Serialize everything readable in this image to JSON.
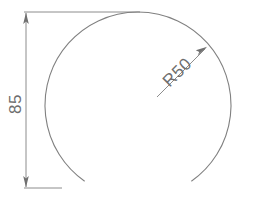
{
  "drawing": {
    "title": "Arc profile with radius and height dimensions",
    "background_color": "#ffffff",
    "line_color": "#808080",
    "text_color": "#6e6e6e",
    "line_width": 1,
    "dimensions": [
      {
        "id": "height-dimension",
        "label": "85",
        "type": "linear-vertical",
        "value": 85,
        "orientation": "vertical",
        "text_rotation_deg": -90,
        "text_x": 17,
        "text_y": 104,
        "dim_line_x": 26,
        "dim_line_y_top": 12,
        "dim_line_y_bottom": 188,
        "extension_top": {
          "x1": 24,
          "y1": 12,
          "x2": 140,
          "y2": 12
        },
        "extension_bottom": {
          "x1": 24,
          "y1": 188,
          "x2": 62,
          "y2": 188
        },
        "arrow_top": {
          "x": 26,
          "y": 13,
          "direction": "up"
        },
        "arrow_bottom": {
          "x": 26,
          "y": 187,
          "direction": "down"
        }
      },
      {
        "id": "radius-dimension",
        "label": "R50",
        "type": "radial",
        "value": 50,
        "prefix": "R",
        "text_rotation_deg": -45,
        "text_x": 178,
        "text_y": 74,
        "leader_start": {
          "x": 157,
          "y": 97
        },
        "leader_end": {
          "x": 207,
          "y": 47
        },
        "arrow_at": "end"
      }
    ],
    "geometry": [
      {
        "id": "main-arc",
        "type": "arc",
        "center_x": 138,
        "center_y": 105,
        "radius": 93,
        "start_angle_deg": 125,
        "end_angle_deg": 55,
        "sweep": "clockwise",
        "note": "truncated circle, open at bottom"
      }
    ]
  }
}
